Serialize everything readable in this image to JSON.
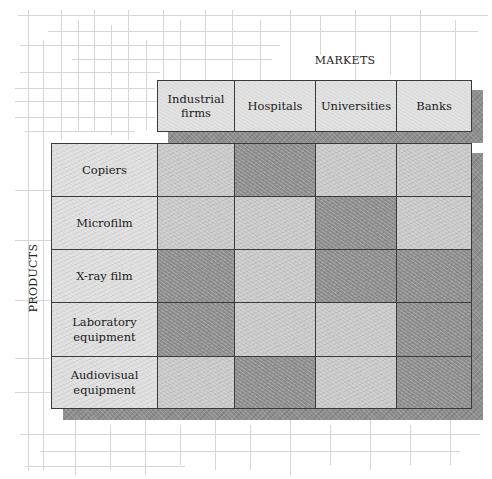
{
  "diagram": {
    "markets_axis_label": "MARKETS",
    "products_axis_label": "PRODUCTS",
    "markets": [
      "Industrial firms",
      "Hospitals",
      "Universities",
      "Banks"
    ],
    "products": [
      "Copiers",
      "Microfilm",
      "X-ray film",
      "Laboratory equipment",
      "Audiovisual equipment"
    ],
    "shading_legend": {
      "light": "#c9c9c9",
      "dark": "#8f8f8f"
    },
    "matrix": [
      [
        "light",
        "dark",
        "light",
        "light"
      ],
      [
        "light",
        "light",
        "dark",
        "light"
      ],
      [
        "dark",
        "light",
        "dark",
        "dark"
      ],
      [
        "dark",
        "light",
        "light",
        "dark"
      ],
      [
        "light",
        "dark",
        "light",
        "dark"
      ]
    ]
  }
}
